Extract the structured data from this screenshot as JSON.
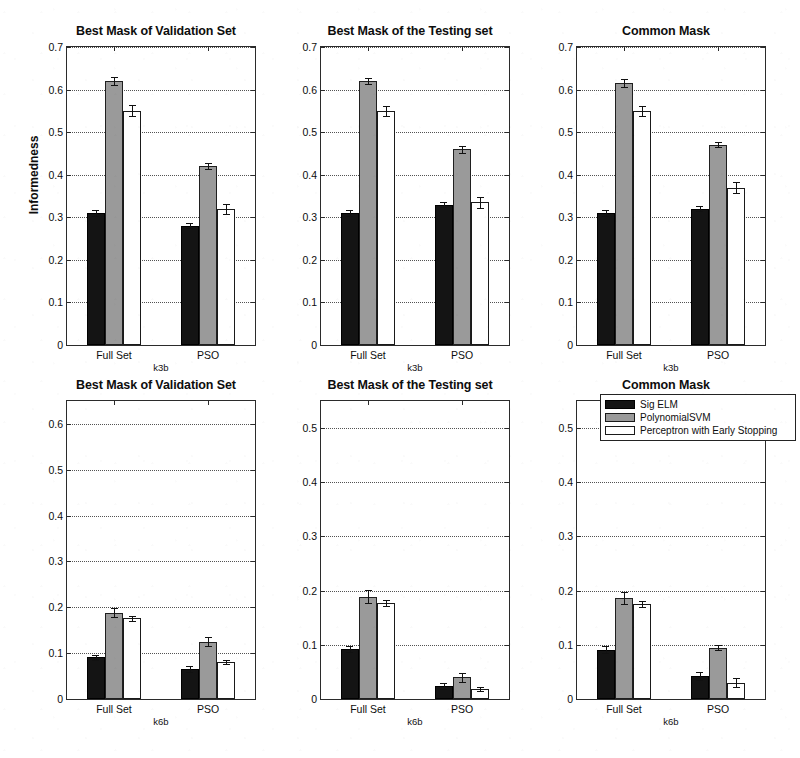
{
  "figure": {
    "ylabel": "Informedness",
    "series_names": [
      "Sig ELM",
      "PolynomialSVM",
      "Perceptron with Early Stopping"
    ],
    "series_colors": [
      "#141414",
      "#9a9a9a",
      "#ffffff"
    ],
    "group_labels": [
      "Full Set",
      "PSO"
    ],
    "row_xlabels": [
      "k3b",
      "k6b"
    ]
  },
  "legend": {
    "items": [
      {
        "label": "Sig ELM",
        "color": "#141414"
      },
      {
        "label": "PolynomialSVM",
        "color": "#9a9a9a"
      },
      {
        "label": "Perceptron with Early Stopping",
        "color": "#ffffff"
      }
    ]
  },
  "chart_data": [
    {
      "type": "bar",
      "panel_id": "k3b-validation",
      "title": "Best Mask of Validation Set",
      "xlabel": "k3b",
      "ylabel": "Informedness",
      "categories": [
        "Full Set",
        "PSO"
      ],
      "ylim": [
        0,
        0.7
      ],
      "yticks": [
        0,
        0.1,
        0.2,
        0.3,
        0.4,
        0.5,
        0.6,
        0.7
      ],
      "yticklabels": [
        "0",
        "0.1",
        "0.2",
        "0.3",
        "0.4",
        "0.5",
        "0.6",
        "0.7"
      ],
      "grid": true,
      "series": [
        {
          "name": "Sig ELM",
          "values": [
            0.31,
            0.28
          ],
          "errors": [
            0.006,
            0.006
          ]
        },
        {
          "name": "PolynomialSVM",
          "values": [
            0.62,
            0.42
          ],
          "errors": [
            0.009,
            0.007
          ]
        },
        {
          "name": "Perceptron with Early Stopping",
          "values": [
            0.55,
            0.32
          ],
          "errors": [
            0.013,
            0.012
          ]
        }
      ]
    },
    {
      "type": "bar",
      "panel_id": "k3b-testing",
      "title": "Best Mask of the Testing set",
      "xlabel": "k3b",
      "ylabel": "",
      "categories": [
        "Full Set",
        "PSO"
      ],
      "ylim": [
        0,
        0.7
      ],
      "yticks": [
        0,
        0.1,
        0.2,
        0.3,
        0.4,
        0.5,
        0.6,
        0.7
      ],
      "yticklabels": [
        "0",
        "0.1",
        "0.2",
        "0.3",
        "0.4",
        "0.5",
        "0.6",
        "0.7"
      ],
      "grid": true,
      "series": [
        {
          "name": "Sig ELM",
          "values": [
            0.31,
            0.33
          ],
          "errors": [
            0.007,
            0.007
          ]
        },
        {
          "name": "PolynomialSVM",
          "values": [
            0.62,
            0.46
          ],
          "errors": [
            0.008,
            0.008
          ]
        },
        {
          "name": "Perceptron with Early Stopping",
          "values": [
            0.55,
            0.335
          ],
          "errors": [
            0.012,
            0.013
          ]
        }
      ]
    },
    {
      "type": "bar",
      "panel_id": "k3b-common",
      "title": "Common Mask",
      "xlabel": "k3b",
      "ylabel": "",
      "categories": [
        "Full Set",
        "PSO"
      ],
      "ylim": [
        0,
        0.7
      ],
      "yticks": [
        0,
        0.1,
        0.2,
        0.3,
        0.4,
        0.5,
        0.6,
        0.7
      ],
      "yticklabels": [
        "0",
        "0.1",
        "0.2",
        "0.3",
        "0.4",
        "0.5",
        "0.6",
        "0.7"
      ],
      "grid": true,
      "series": [
        {
          "name": "Sig ELM",
          "values": [
            0.31,
            0.32
          ],
          "errors": [
            0.006,
            0.006
          ]
        },
        {
          "name": "PolynomialSVM",
          "values": [
            0.615,
            0.47
          ],
          "errors": [
            0.009,
            0.006
          ]
        },
        {
          "name": "Perceptron with Early Stopping",
          "values": [
            0.55,
            0.37
          ],
          "errors": [
            0.012,
            0.013
          ]
        }
      ]
    },
    {
      "type": "bar",
      "panel_id": "k6b-validation",
      "title": "Best Mask of Validation Set",
      "xlabel": "k6b",
      "ylabel": "",
      "categories": [
        "Full Set",
        "PSO"
      ],
      "ylim": [
        0,
        0.65
      ],
      "yticks": [
        0,
        0.1,
        0.2,
        0.3,
        0.4,
        0.5,
        0.6
      ],
      "yticklabels": [
        "0",
        "0.1",
        "0.2",
        "0.3",
        "0.4",
        "0.5",
        "0.6"
      ],
      "grid": true,
      "series": [
        {
          "name": "Sig ELM",
          "values": [
            0.091,
            0.065
          ],
          "errors": [
            0.006,
            0.007
          ]
        },
        {
          "name": "PolynomialSVM",
          "values": [
            0.188,
            0.125
          ],
          "errors": [
            0.01,
            0.01
          ]
        },
        {
          "name": "Perceptron with Early Stopping",
          "values": [
            0.176,
            0.081
          ],
          "errors": [
            0.005,
            0.005
          ]
        }
      ]
    },
    {
      "type": "bar",
      "panel_id": "k6b-testing",
      "title": "Best Mask of the Testing set",
      "xlabel": "k6b",
      "ylabel": "",
      "categories": [
        "Full Set",
        "PSO"
      ],
      "ylim": [
        0,
        0.55
      ],
      "yticks": [
        0,
        0.1,
        0.2,
        0.3,
        0.4,
        0.5
      ],
      "yticklabels": [
        "0",
        "0.1",
        "0.2",
        "0.3",
        "0.4",
        "0.5"
      ],
      "grid": true,
      "series": [
        {
          "name": "Sig ELM",
          "values": [
            0.092,
            0.024
          ],
          "errors": [
            0.006,
            0.005
          ]
        },
        {
          "name": "PolynomialSVM",
          "values": [
            0.189,
            0.04
          ],
          "errors": [
            0.012,
            0.008
          ]
        },
        {
          "name": "Perceptron with Early Stopping",
          "values": [
            0.177,
            0.019
          ],
          "errors": [
            0.006,
            0.004
          ]
        }
      ]
    },
    {
      "type": "bar",
      "panel_id": "k6b-common",
      "title": "Common Mask",
      "xlabel": "k6b",
      "ylabel": "",
      "categories": [
        "Full Set",
        "PSO"
      ],
      "ylim": [
        0,
        0.55
      ],
      "yticks": [
        0,
        0.1,
        0.2,
        0.3,
        0.4,
        0.5
      ],
      "yticklabels": [
        "0",
        "0.1",
        "0.2",
        "0.3",
        "0.4",
        "0.5"
      ],
      "grid": true,
      "series": [
        {
          "name": "Sig ELM",
          "values": [
            0.091,
            0.042
          ],
          "errors": [
            0.006,
            0.007
          ]
        },
        {
          "name": "PolynomialSVM",
          "values": [
            0.186,
            0.095
          ],
          "errors": [
            0.011,
            0.005
          ]
        },
        {
          "name": "Perceptron with Early Stopping",
          "values": [
            0.175,
            0.03
          ],
          "errors": [
            0.005,
            0.008
          ]
        }
      ]
    }
  ]
}
